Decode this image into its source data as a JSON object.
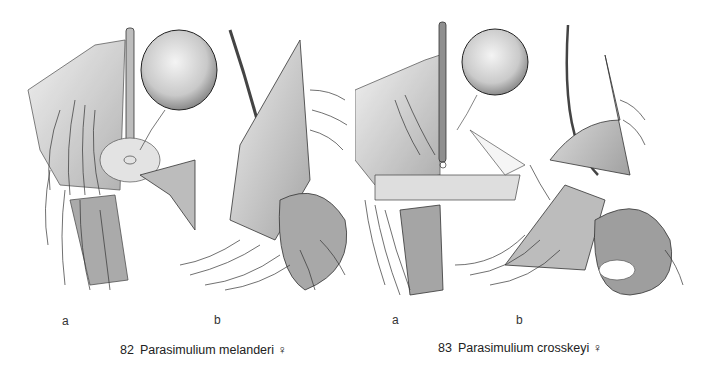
{
  "figures": [
    {
      "number": "82",
      "species": "Parasimulium melanderi",
      "sex_symbol": "♀",
      "panels": [
        {
          "label": "a",
          "description": "ventral view of female terminalia"
        },
        {
          "label": "b",
          "description": "lateral view of female terminalia"
        }
      ]
    },
    {
      "number": "83",
      "species": "Parasimulium crosskeyi",
      "sex_symbol": "♀",
      "panels": [
        {
          "label": "a",
          "description": "ventral view of female terminalia"
        },
        {
          "label": "b",
          "description": "lateral view of female terminalia"
        }
      ]
    }
  ],
  "colors": {
    "ink": "#2a2a2a",
    "stipple": "#9a9a9a",
    "background": "#ffffff"
  }
}
